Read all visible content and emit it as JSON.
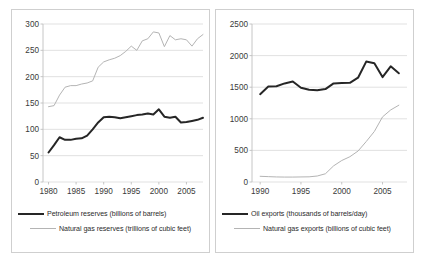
{
  "figure": {
    "background": "#ffffff",
    "border_color": "#cfcfcf",
    "dark_series_color": "#262626",
    "light_series_color": "#b4b4b4",
    "grid_color": "#d9d9d9",
    "axis_color": "#bfbfbf"
  },
  "left_panel": {
    "legend": [
      {
        "label": "Petroleum reserves (billions of barrels)",
        "style": "dark"
      },
      {
        "label": "Natural gas reserves (trillions of cubic feet)",
        "style": "light"
      }
    ]
  },
  "right_panel": {
    "legend": [
      {
        "label": "Oil exports (thousands of barrels/day)",
        "style": "dark"
      },
      {
        "label": "Natural gas exports (billions of cubic feet)",
        "style": "light"
      }
    ]
  },
  "chart_data": [
    {
      "id": "reserves",
      "type": "line",
      "title": "",
      "xlabel": "",
      "ylabel": "",
      "xlim": [
        1979,
        2008
      ],
      "ylim": [
        0,
        300
      ],
      "grid": true,
      "grid_axis": "y",
      "legend_position": "below",
      "xticks": [
        1980,
        1985,
        1990,
        1995,
        2000,
        2005
      ],
      "xtick_labels": [
        "1980",
        "1985",
        "1990",
        "1995",
        "2000",
        "2005"
      ],
      "yticks": [
        0,
        50,
        100,
        150,
        200,
        250,
        300
      ],
      "ytick_labels": [
        "0",
        "50",
        "100",
        "150",
        "200",
        "250",
        "300"
      ],
      "x": [
        1980,
        1981,
        1982,
        1983,
        1984,
        1985,
        1986,
        1987,
        1988,
        1989,
        1990,
        1991,
        1992,
        1993,
        1994,
        1995,
        1996,
        1997,
        1998,
        1999,
        2000,
        2001,
        2002,
        2003,
        2004,
        2005,
        2006,
        2007,
        2008
      ],
      "series": [
        {
          "name": "Petroleum reserves (billions of barrels)",
          "style": "dark",
          "units": "billions of barrels",
          "values": [
            56,
            70,
            85,
            80,
            80,
            82,
            83,
            88,
            100,
            113,
            123,
            124,
            123,
            121,
            123,
            125,
            127,
            128,
            130,
            128,
            138,
            124,
            122,
            124,
            113,
            114,
            116,
            118,
            122
          ]
        },
        {
          "name": "Natural gas reserves (trillions of cubic feet)",
          "style": "light",
          "units": "trillions of cubic feet",
          "values": [
            143,
            145,
            165,
            180,
            183,
            183,
            186,
            188,
            192,
            218,
            228,
            232,
            235,
            240,
            248,
            258,
            250,
            268,
            272,
            285,
            283,
            257,
            278,
            270,
            272,
            270,
            258,
            272,
            280
          ]
        }
      ]
    },
    {
      "id": "exports",
      "type": "line",
      "title": "",
      "xlabel": "",
      "ylabel": "",
      "xlim": [
        1989,
        2008
      ],
      "ylim": [
        0,
        2500
      ],
      "grid": true,
      "grid_axis": "y",
      "legend_position": "below",
      "xticks": [
        1990,
        1995,
        2000,
        2005
      ],
      "xtick_labels": [
        "1990",
        "1995",
        "2000",
        "2005"
      ],
      "yticks": [
        0,
        500,
        1000,
        1500,
        2000,
        2500
      ],
      "ytick_labels": [
        "0",
        "500",
        "1000",
        "1500",
        "2000",
        "2500"
      ],
      "x": [
        1990,
        1991,
        1992,
        1993,
        1994,
        1995,
        1996,
        1997,
        1998,
        1999,
        2000,
        2001,
        2002,
        2003,
        2004,
        2005,
        2006,
        2007
      ],
      "series": [
        {
          "name": "Oil exports (thousands of barrels/day)",
          "style": "dark",
          "units": "thousands of barrels/day",
          "values": [
            1390,
            1510,
            1515,
            1560,
            1590,
            1490,
            1460,
            1450,
            1470,
            1560,
            1565,
            1570,
            1650,
            1905,
            1880,
            1660,
            1830,
            1720
          ]
        },
        {
          "name": "Natural gas exports (billions of cubic feet)",
          "style": "light",
          "units": "billions of cubic feet",
          "values": [
            90,
            85,
            80,
            78,
            78,
            80,
            82,
            95,
            130,
            255,
            340,
            400,
            490,
            640,
            800,
            1030,
            1140,
            1215
          ]
        }
      ]
    }
  ]
}
